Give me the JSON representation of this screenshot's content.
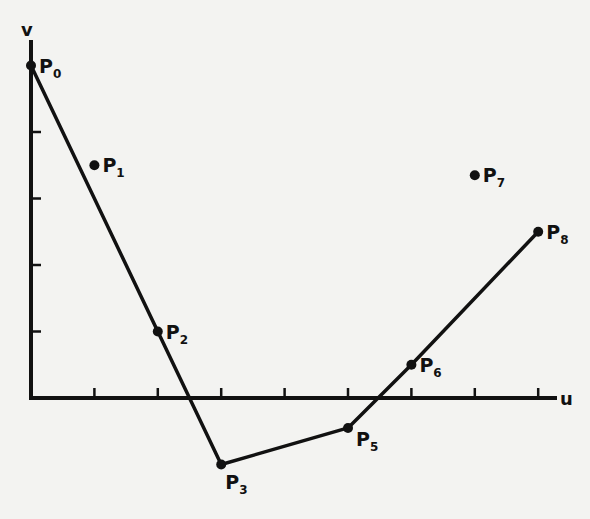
{
  "chart_data": {
    "type": "line",
    "title": "",
    "xlabel": "u",
    "ylabel": "v",
    "xlim": [
      0,
      8.4
    ],
    "ylim": [
      -1.5,
      5.3
    ],
    "x_ticks": [
      1,
      2,
      3,
      4,
      5,
      6,
      7,
      8
    ],
    "y_ticks": [
      1,
      2,
      3,
      4
    ],
    "grid": false,
    "points": [
      {
        "name": "P",
        "sub": "0",
        "u": 0,
        "v": 5,
        "on_path": true,
        "label_pos": "right"
      },
      {
        "name": "P",
        "sub": "1",
        "u": 1,
        "v": 3.5,
        "on_path": false,
        "label_pos": "right"
      },
      {
        "name": "P",
        "sub": "2",
        "u": 2,
        "v": 1,
        "on_path": true,
        "label_pos": "right"
      },
      {
        "name": "P",
        "sub": "3",
        "u": 3,
        "v": -1,
        "on_path": true,
        "label_pos": "below"
      },
      {
        "name": "P",
        "sub": "5",
        "u": 5,
        "v": -0.45,
        "on_path": true,
        "label_pos": "below-right"
      },
      {
        "name": "P",
        "sub": "6",
        "u": 6,
        "v": 0.5,
        "on_path": true,
        "label_pos": "right"
      },
      {
        "name": "P",
        "sub": "7",
        "u": 7,
        "v": 3.35,
        "on_path": false,
        "label_pos": "right"
      },
      {
        "name": "P",
        "sub": "8",
        "u": 8,
        "v": 2.5,
        "on_path": true,
        "label_pos": "right"
      }
    ],
    "path_order": [
      "0",
      "2",
      "3",
      "5",
      "6",
      "8"
    ]
  }
}
